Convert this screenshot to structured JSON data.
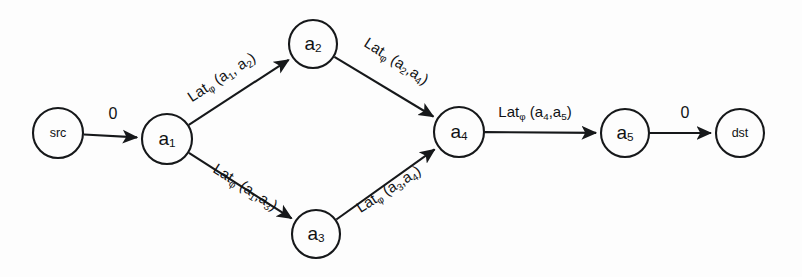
{
  "diagram": {
    "type": "directed-graph",
    "background_color": "#fdfdfd",
    "stroke_color": "#16181a",
    "nodes": [
      {
        "id": "src",
        "label": "src",
        "label_style": "terminal",
        "cx": 58,
        "cy": 133,
        "r": 25
      },
      {
        "id": "a1",
        "label": "a",
        "sub": "1",
        "label_style": "alpha",
        "cx": 167,
        "cy": 139,
        "r": 25
      },
      {
        "id": "a2",
        "label": "a",
        "sub": "2",
        "label_style": "alpha",
        "cx": 313,
        "cy": 44,
        "r": 24
      },
      {
        "id": "a3",
        "label": "a",
        "sub": "3",
        "label_style": "alpha",
        "cx": 316,
        "cy": 234,
        "r": 24
      },
      {
        "id": "a4",
        "label": "a",
        "sub": "4",
        "label_style": "alpha",
        "cx": 459,
        "cy": 132,
        "r": 25
      },
      {
        "id": "a5",
        "label": "a",
        "sub": "5",
        "label_style": "alpha",
        "cx": 625,
        "cy": 133,
        "r": 24
      },
      {
        "id": "dst",
        "label": "dst",
        "label_style": "terminal",
        "cx": 740,
        "cy": 133,
        "r": 24
      }
    ],
    "edges": [
      {
        "id": "e-src-a1",
        "from": "src",
        "to": "a1",
        "label": "0",
        "label_kind": "weight",
        "label_x": 113,
        "label_y": 115,
        "label_rotate": 0
      },
      {
        "id": "e-a1-a2",
        "from": "a1",
        "to": "a2",
        "label": "Lat",
        "sub_phi": "φ",
        "args": " (a",
        "arg1": "1",
        "argmid": ", a",
        "arg2": "2",
        "argend": ")",
        "label_text": "Latφ (a1, a2)",
        "label_kind": "latency",
        "label_x": 222,
        "label_y": 78,
        "label_rotate": -33
      },
      {
        "id": "e-a2-a4",
        "from": "a2",
        "to": "a4",
        "label": "Lat",
        "sub_phi": "φ",
        "args": " (a",
        "arg1": "2",
        "argmid": ",a",
        "arg2": "4",
        "argend": ")",
        "label_text": "Latφ (a2,a4)",
        "label_kind": "latency",
        "label_x": 396,
        "label_y": 62,
        "label_rotate": 33
      },
      {
        "id": "e-a1-a3",
        "from": "a1",
        "to": "a3",
        "label": "Lat",
        "sub_phi": "φ",
        "args": " (a",
        "arg1": "1",
        "argmid": ",a",
        "arg2": "3",
        "argend": ")",
        "label_text": "Latφ (a1,a3)",
        "label_kind": "latency",
        "label_x": 245,
        "label_y": 188,
        "label_rotate": 33
      },
      {
        "id": "e-a3-a4",
        "from": "a3",
        "to": "a4",
        "label": "Lat",
        "sub_phi": "φ",
        "args": " (a",
        "arg1": "3",
        "argmid": ",a",
        "arg2": "4",
        "argend": ")",
        "label_text": "Latφ (a3,a4)",
        "label_kind": "latency",
        "label_x": 389,
        "label_y": 190,
        "label_rotate": -33
      },
      {
        "id": "e-a4-a5",
        "from": "a4",
        "to": "a5",
        "label": "Lat",
        "sub_phi": "φ",
        "args": " (a",
        "arg1": "4",
        "argmid": ",a",
        "arg2": "5",
        "argend": ")",
        "label_text": "Latφ (a4,a5)",
        "label_kind": "latency",
        "label_x": 535,
        "label_y": 113,
        "label_rotate": 0
      },
      {
        "id": "e-a5-dst",
        "from": "a5",
        "to": "dst",
        "label": "0",
        "label_kind": "weight",
        "label_x": 685,
        "label_y": 114,
        "label_rotate": 0
      }
    ]
  }
}
